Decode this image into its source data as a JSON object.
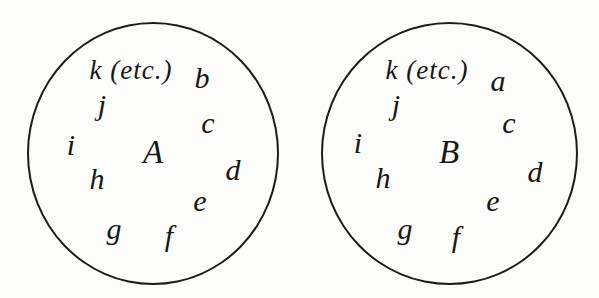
{
  "page": {
    "background": "#fcfcfa",
    "ink": "#1c1c1c"
  },
  "diagram": {
    "type": "set-diagram",
    "circles": [
      {
        "label": "A",
        "label_pos": {
          "x": 153,
          "y": 152
        },
        "bounds": {
          "left": 27,
          "top": 22,
          "width": 252,
          "height": 263
        },
        "members": [
          {
            "text": "k (etc.)",
            "x": 131,
            "y": 70
          },
          {
            "text": "b",
            "x": 202,
            "y": 78
          },
          {
            "text": "j",
            "x": 102,
            "y": 105
          },
          {
            "text": "c",
            "x": 208,
            "y": 123
          },
          {
            "text": "i",
            "x": 71,
            "y": 145
          },
          {
            "text": "d",
            "x": 233,
            "y": 170
          },
          {
            "text": "h",
            "x": 97,
            "y": 179
          },
          {
            "text": "e",
            "x": 200,
            "y": 201
          },
          {
            "text": "g",
            "x": 114,
            "y": 229
          },
          {
            "text": "f",
            "x": 169,
            "y": 236
          }
        ]
      },
      {
        "label": "B",
        "label_pos": {
          "x": 449,
          "y": 152
        },
        "bounds": {
          "left": 321,
          "top": 22,
          "width": 257,
          "height": 263
        },
        "members": [
          {
            "text": "k (etc.)",
            "x": 427,
            "y": 70
          },
          {
            "text": "a",
            "x": 498,
            "y": 81
          },
          {
            "text": "j",
            "x": 396,
            "y": 105
          },
          {
            "text": "c",
            "x": 509,
            "y": 123
          },
          {
            "text": "i",
            "x": 358,
            "y": 143
          },
          {
            "text": "d",
            "x": 535,
            "y": 172
          },
          {
            "text": "h",
            "x": 383,
            "y": 178
          },
          {
            "text": "e",
            "x": 493,
            "y": 201
          },
          {
            "text": "g",
            "x": 405,
            "y": 229
          },
          {
            "text": "f",
            "x": 456,
            "y": 237
          }
        ]
      }
    ]
  }
}
